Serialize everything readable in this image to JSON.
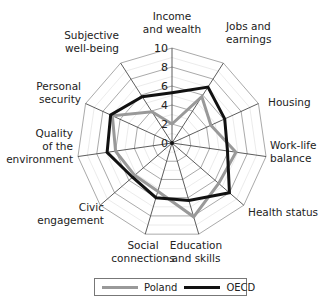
{
  "chart_data": {
    "type": "radar",
    "title": "",
    "axes": [
      "Income and wealth",
      "Jobs and earnings",
      "Housing",
      "Work-life balance",
      "Health status",
      "Education and skills",
      "Social connections",
      "Civic engagement",
      "Quality of the environment",
      "Personal security",
      "Subjective well-being"
    ],
    "axis_label_lines": [
      [
        "Income",
        "and wealth"
      ],
      [
        "Jobs and",
        "earnings"
      ],
      [
        "Housing"
      ],
      [
        "Work-life",
        "balance"
      ],
      [
        "Health status"
      ],
      [
        "Education",
        "and skills"
      ],
      [
        "Social",
        "connections"
      ],
      [
        "Civic",
        "engagement"
      ],
      [
        "Quality",
        "of the",
        "environment"
      ],
      [
        "Personal",
        "security"
      ],
      [
        "Subjective",
        "well-being"
      ]
    ],
    "radial_ticks": [
      "0",
      "2",
      "4",
      "6",
      "8",
      "10"
    ],
    "range": [
      0,
      10
    ],
    "grid": true,
    "legend_position": "bottom",
    "series": [
      {
        "name": "Poland",
        "color": "#999999",
        "values": [
          2.0,
          5.8,
          4.5,
          6.8,
          6.5,
          8.1,
          5.3,
          5.2,
          6.0,
          6.9,
          3.9
        ]
      },
      {
        "name": "OECD",
        "color": "#111111",
        "values": [
          5.3,
          7.0,
          6.1,
          5.9,
          8.0,
          6.3,
          6.0,
          5.5,
          6.9,
          7.1,
          5.8
        ]
      }
    ]
  },
  "legend": {
    "poland": "Poland",
    "oecd": "OECD"
  }
}
